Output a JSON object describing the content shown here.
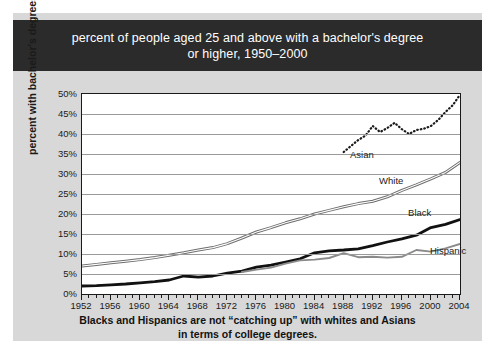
{
  "header": {
    "line1": "percent of people aged 25 and above with a bachelor's degree",
    "line2": "or higher, 1950–2000"
  },
  "caption": {
    "line1": "Blacks and Hispanics are not “catching up” with whites and Asians",
    "line2": "in terms of college degrees."
  },
  "colors": {
    "header_bg": "#2b2b2b",
    "card_bg": "#d8d8d8",
    "plot_bg": "#ffffff",
    "gridline": "#9a9a9a",
    "axis": "#1a1a1a",
    "asian": "#1a1a1a",
    "white_series": "#6e6e6e",
    "black_series": "#111111",
    "hispanic": "#8a8a8a"
  },
  "chart_data": {
    "type": "line",
    "title": "percent of people aged 25 and above with a bachelor's degree or higher, 1950–2000",
    "xlabel": "",
    "ylabel": "percent with bachelor's degrees",
    "xlim": [
      1952,
      2004
    ],
    "ylim": [
      0,
      50
    ],
    "grid": true,
    "legend_position": "inline-labels",
    "ytick_labels": [
      "0%",
      "5%",
      "10%",
      "15%",
      "20%",
      "25%",
      "30%",
      "35%",
      "40%",
      "45%",
      "50%"
    ],
    "ytick_values": [
      0,
      5,
      10,
      15,
      20,
      25,
      30,
      35,
      40,
      45,
      50
    ],
    "xtick_labels": [
      "1952",
      "1956",
      "1960",
      "1964",
      "1968",
      "1972",
      "1976",
      "1980",
      "1984",
      "1988",
      "1992",
      "1996",
      "2000",
      "2004"
    ],
    "xtick_values": [
      1952,
      1956,
      1960,
      1964,
      1968,
      1972,
      1976,
      1980,
      1984,
      1988,
      1992,
      1996,
      2000,
      2004
    ],
    "xtick_minor_step": 1,
    "series": [
      {
        "name": "Asian",
        "style": "dotted",
        "color": "#1a1a1a",
        "label_x": 1989,
        "label_y": 34.5,
        "x": [
          1988,
          1989,
          1990,
          1991,
          1992,
          1993,
          1994,
          1995,
          1996,
          1997,
          1998,
          1999,
          2000,
          2001,
          2002,
          2003,
          2004
        ],
        "values": [
          35.5,
          37.0,
          38.5,
          39.6,
          42.0,
          40.5,
          41.5,
          42.8,
          41.2,
          40.0,
          41.0,
          41.3,
          42.0,
          43.5,
          45.5,
          47.2,
          49.8
        ]
      },
      {
        "name": "White",
        "style": "double",
        "color": "#6e6e6e",
        "label_x": 1993,
        "label_y": 28.0,
        "x": [
          1952,
          1954,
          1956,
          1958,
          1960,
          1962,
          1964,
          1966,
          1968,
          1970,
          1972,
          1974,
          1976,
          1978,
          1980,
          1982,
          1984,
          1986,
          1988,
          1990,
          1992,
          1994,
          1996,
          1998,
          2000,
          2002,
          2004
        ],
        "values": [
          7.0,
          7.4,
          7.8,
          8.2,
          8.6,
          9.1,
          9.7,
          10.3,
          11.0,
          11.6,
          12.6,
          14.0,
          15.5,
          16.6,
          17.8,
          18.8,
          20.0,
          20.9,
          21.8,
          22.6,
          23.2,
          24.3,
          25.9,
          27.3,
          28.8,
          30.4,
          32.9
        ]
      },
      {
        "name": "Black",
        "style": "thick",
        "color": "#111111",
        "label_x": 1997,
        "label_y": 20.0,
        "x": [
          1952,
          1954,
          1956,
          1958,
          1960,
          1962,
          1964,
          1966,
          1968,
          1970,
          1972,
          1974,
          1976,
          1978,
          1980,
          1982,
          1984,
          1986,
          1988,
          1990,
          1992,
          1994,
          1996,
          1998,
          2000,
          2002,
          2004
        ],
        "values": [
          2.0,
          2.1,
          2.3,
          2.5,
          2.8,
          3.1,
          3.5,
          4.5,
          4.2,
          4.5,
          5.2,
          5.7,
          6.7,
          7.2,
          8.0,
          8.8,
          10.3,
          10.8,
          11.0,
          11.3,
          12.1,
          13.0,
          13.8,
          14.7,
          16.6,
          17.4,
          18.6
        ]
      },
      {
        "name": "Hispanic",
        "style": "medium",
        "color": "#8a8a8a",
        "label_x": 2000,
        "label_y": 10.5,
        "x": [
          1974,
          1976,
          1978,
          1980,
          1982,
          1984,
          1986,
          1988,
          1990,
          1992,
          1994,
          1996,
          1998,
          2000,
          2002,
          2004
        ],
        "values": [
          5.5,
          6.1,
          6.6,
          7.6,
          8.4,
          8.6,
          9.0,
          10.2,
          9.2,
          9.3,
          9.1,
          9.3,
          11.0,
          10.6,
          11.4,
          12.5
        ]
      }
    ]
  }
}
